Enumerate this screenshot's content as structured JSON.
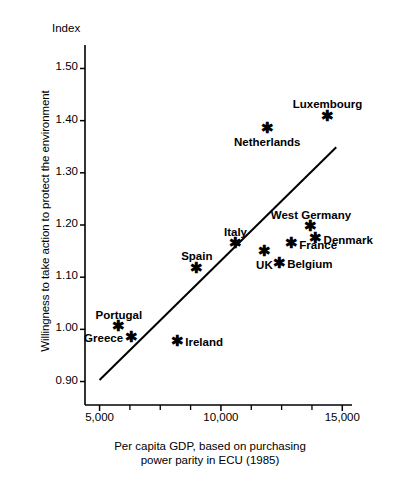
{
  "chart_data": {
    "type": "scatter",
    "title": "",
    "index_label": "Index",
    "xlabel": "Per capita GDP, based on purchasing power parity in ECU (1985)",
    "xlabel_line1": "Per capita GDP, based on purchasing",
    "xlabel_line2": "power parity in ECU (1985)",
    "ylabel": "Willingness to take action to protect the environment",
    "xlim": [
      4400,
      15400
    ],
    "ylim": [
      0.855,
      1.545
    ],
    "grid": false,
    "legend": null,
    "x_ticks": [
      5000,
      10000,
      15000
    ],
    "x_tick_labels": [
      "5,000",
      "10,000",
      "15,000"
    ],
    "x_minor_ticks": [
      6250,
      7500,
      8750,
      11250,
      12500,
      13750
    ],
    "y_ticks": [
      0.9,
      1.0,
      1.1,
      1.2,
      1.3,
      1.4,
      1.5
    ],
    "y_tick_labels": [
      "0.90",
      "1.00",
      "1.10",
      "1.20",
      "1.30",
      "1.40",
      "1.50"
    ],
    "marker": "asterisk",
    "points": [
      {
        "name": "Luxembourg",
        "x": 14400,
        "y": 1.407,
        "label_pos": "above"
      },
      {
        "name": "Netherlands",
        "x": 11900,
        "y": 1.383,
        "label_pos": "below"
      },
      {
        "name": "West Germany",
        "x": 13700,
        "y": 1.195,
        "label_pos": "above"
      },
      {
        "name": "Denmark",
        "x": 13900,
        "y": 1.172,
        "label_pos": "right"
      },
      {
        "name": "France",
        "x": 12900,
        "y": 1.162,
        "label_pos": "right"
      },
      {
        "name": "Italy",
        "x": 10600,
        "y": 1.162,
        "label_pos": "above"
      },
      {
        "name": "UK",
        "x": 11800,
        "y": 1.147,
        "label_pos": "below"
      },
      {
        "name": "Belgium",
        "x": 12400,
        "y": 1.125,
        "label_pos": "right"
      },
      {
        "name": "Spain",
        "x": 9000,
        "y": 1.115,
        "label_pos": "above"
      },
      {
        "name": "Portugal",
        "x": 5800,
        "y": 1.003,
        "label_pos": "above"
      },
      {
        "name": "Greece",
        "x": 6300,
        "y": 0.983,
        "label_pos": "left"
      },
      {
        "name": "Ireland",
        "x": 8200,
        "y": 0.975,
        "label_pos": "right"
      }
    ],
    "trendline": {
      "x_start": 5000,
      "y_start": 0.903,
      "x_end": 14750,
      "y_end": 1.349
    }
  }
}
